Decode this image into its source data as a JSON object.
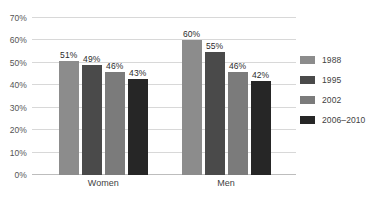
{
  "chart_data": {
    "type": "bar",
    "title": "",
    "subtitle": "",
    "xlabel": "",
    "ylabel": "",
    "categories": [
      "Women",
      "Men"
    ],
    "series": [
      {
        "name": "1988",
        "color": "#8c8c8c",
        "values": [
          51,
          60
        ],
        "labels": [
          "51%",
          "60%"
        ]
      },
      {
        "name": "1995",
        "color": "#4a4a4a",
        "values": [
          49,
          55
        ],
        "labels": [
          "49%",
          "55%"
        ]
      },
      {
        "name": "2002",
        "color": "#7b7b7b",
        "values": [
          46,
          46
        ],
        "labels": [
          "46%",
          "46%"
        ]
      },
      {
        "name": "2006–2010",
        "color": "#262626",
        "values": [
          43,
          42
        ],
        "labels": [
          "43%",
          "42%"
        ]
      }
    ],
    "ylim": [
      0,
      70
    ],
    "yticks": [
      0,
      10,
      20,
      30,
      40,
      50,
      60,
      70
    ],
    "ytick_labels": [
      "0%",
      "10%",
      "20%",
      "30%",
      "40%",
      "50%",
      "60%",
      "70%"
    ],
    "grid": true,
    "legend_position": "right",
    "value_labels": true
  },
  "legend": {
    "items": [
      {
        "label": "1988",
        "color": "#8c8c8c"
      },
      {
        "label": "1995",
        "color": "#4a4a4a"
      },
      {
        "label": "2002",
        "color": "#7b7b7b"
      },
      {
        "label": "2006–2010",
        "color": "#262626"
      }
    ]
  }
}
